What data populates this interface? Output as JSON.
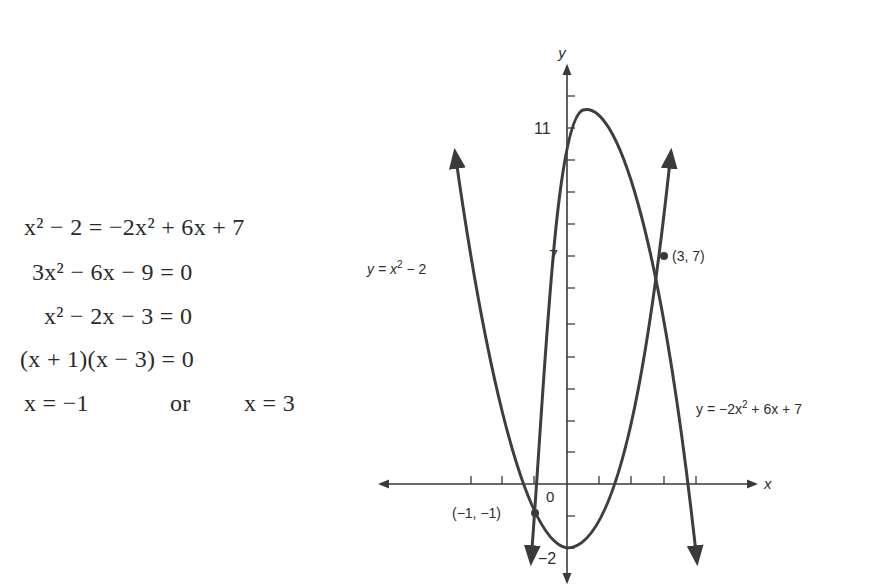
{
  "derivation": {
    "lines": [
      "x² − 2 = −2x² + 6x + 7",
      "3x² − 6x − 9 = 0",
      "x² − 2x − 3 = 0",
      "(x + 1)(x − 3) = 0",
      "x = −1",
      "or",
      "x = 3"
    ]
  },
  "graph": {
    "x_axis_label": "x",
    "y_axis_label": "y",
    "origin_label": "0",
    "y_tick_labels": {
      "top": "11",
      "mid": "7",
      "bottom": "−2"
    },
    "curves": [
      {
        "label": "y = x² − 2",
        "label_display": "y = x",
        "label_sup": "2",
        "label_tail": " − 2"
      },
      {
        "label": "y = −2x² + 6x + 7",
        "label_display": "y = −2x",
        "label_sup": "2",
        "label_tail": " + 6x + 7"
      }
    ],
    "points": [
      {
        "label": "(3, 7)",
        "x": 3,
        "y": 7
      },
      {
        "label": "(−1, −1)",
        "x": -1,
        "y": -1
      }
    ],
    "colors": {
      "ink": "#3a3a3a",
      "text": "#2e2e2e"
    }
  }
}
